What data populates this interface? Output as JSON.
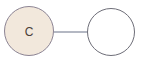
{
  "diagram": {
    "type": "node-link-graph",
    "background_color": "#ffffff",
    "width": 144,
    "height": 62,
    "nodes": [
      {
        "id": "node-c",
        "label": "C",
        "shape": "circle",
        "cx": 29,
        "cy": 31,
        "r": 24.5,
        "fill_color": "#f2e8dc",
        "stroke_color": "#8c8494",
        "stroke_width": 1,
        "label_color": "#4a4038",
        "label_font_size": 12,
        "filled": true
      },
      {
        "id": "node-empty",
        "label": "",
        "shape": "circle",
        "cx": 111,
        "cy": 32,
        "r": 23.5,
        "fill_color": "#ffffff",
        "stroke_color": "#6e6e78",
        "stroke_width": 1,
        "label_color": "#4a4038",
        "label_font_size": 12,
        "filled": false
      }
    ],
    "edges": [
      {
        "id": "edge-c-to-empty",
        "source": "node-c",
        "target": "node-empty",
        "x1": 53.5,
        "y1": 32,
        "x2": 87.5,
        "y2": 32,
        "stroke_color": "#6b7288",
        "stroke_width": 1.2
      }
    ]
  }
}
